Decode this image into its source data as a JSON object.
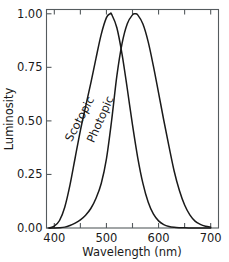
{
  "chart_data": {
    "type": "line",
    "title": "",
    "xlabel": "Wavelength (nm)",
    "ylabel": "Luminosity",
    "xlim": [
      385,
      715
    ],
    "ylim": [
      0.0,
      1.02
    ],
    "grid": false,
    "legend": "inline-curve-labels",
    "xticks": [
      400,
      450,
      500,
      550,
      600,
      650,
      700
    ],
    "xtick_labels": [
      "400",
      "",
      "500",
      "",
      "600",
      "",
      "700"
    ],
    "yticks": [
      0.0,
      0.25,
      0.5,
      0.75,
      1.0
    ],
    "ytick_labels": [
      "0.00",
      "0.25",
      "0.50",
      "0.75",
      "1.00"
    ],
    "annotations": [
      {
        "text": "Scotopic",
        "x": 455,
        "y": 0.5,
        "rotation": -62
      },
      {
        "text": "Photopic",
        "x": 495,
        "y": 0.5,
        "rotation": -66
      }
    ],
    "series": [
      {
        "name": "Scotopic",
        "peak_x": 507,
        "peak_y": 1.0,
        "x": [
          390,
          400,
          410,
          420,
          430,
          440,
          450,
          460,
          470,
          480,
          490,
          500,
          507,
          510,
          520,
          530,
          540,
          550,
          560,
          570,
          580,
          590,
          600,
          610,
          620,
          630,
          640,
          650,
          660,
          670,
          680,
          690,
          700
        ],
        "y": [
          0.0,
          0.009,
          0.035,
          0.097,
          0.2,
          0.328,
          0.455,
          0.567,
          0.676,
          0.793,
          0.904,
          0.982,
          1.0,
          0.997,
          0.935,
          0.811,
          0.65,
          0.481,
          0.329,
          0.208,
          0.121,
          0.0655,
          0.0332,
          0.0159,
          0.00737,
          0.00334,
          0.0015,
          0.000677,
          0.000313,
          0.000148,
          7.2e-05,
          3.5e-05,
          1.8e-05
        ]
      },
      {
        "name": "Photopic",
        "peak_x": 555,
        "peak_y": 1.0,
        "x": [
          390,
          400,
          410,
          420,
          430,
          440,
          450,
          460,
          470,
          480,
          490,
          500,
          510,
          520,
          530,
          540,
          550,
          555,
          560,
          570,
          580,
          590,
          600,
          610,
          620,
          630,
          640,
          650,
          660,
          670,
          680,
          690,
          700
        ],
        "y": [
          0.0001,
          0.0004,
          0.0012,
          0.004,
          0.0116,
          0.023,
          0.038,
          0.06,
          0.091,
          0.139,
          0.208,
          0.323,
          0.503,
          0.71,
          0.862,
          0.954,
          0.995,
          1.0,
          0.995,
          0.952,
          0.87,
          0.757,
          0.631,
          0.503,
          0.381,
          0.265,
          0.175,
          0.107,
          0.061,
          0.032,
          0.017,
          0.0082,
          0.0041
        ]
      }
    ]
  }
}
